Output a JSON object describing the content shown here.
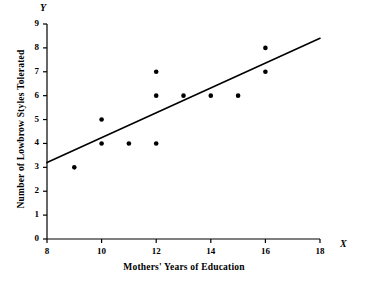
{
  "chart_data": {
    "type": "scatter",
    "title": "",
    "xlabel": "Mothers' Years of Education",
    "ylabel": "Number of Lowbrow Styles Tolerated",
    "x_axis_letter": "X",
    "y_axis_letter": "Y",
    "xlim": [
      8,
      18
    ],
    "ylim": [
      0,
      9
    ],
    "grid": false,
    "legend": "none",
    "x_ticks": [
      8,
      10,
      12,
      14,
      16,
      18
    ],
    "x_tick_labels": [
      "8",
      "10",
      "12",
      "14",
      "16",
      "18"
    ],
    "y_ticks": [
      0,
      1,
      2,
      3,
      4,
      5,
      6,
      7,
      8,
      9
    ],
    "y_tick_labels": [
      "0",
      "1",
      "2",
      "3",
      "4",
      "5",
      "6",
      "7",
      "8",
      "9"
    ],
    "points": [
      {
        "x": 9,
        "y": 3
      },
      {
        "x": 10,
        "y": 5
      },
      {
        "x": 10,
        "y": 4
      },
      {
        "x": 11,
        "y": 4
      },
      {
        "x": 12,
        "y": 7
      },
      {
        "x": 12,
        "y": 6
      },
      {
        "x": 12,
        "y": 4
      },
      {
        "x": 13,
        "y": 6
      },
      {
        "x": 14,
        "y": 6
      },
      {
        "x": 15,
        "y": 6
      },
      {
        "x": 16,
        "y": 8
      },
      {
        "x": 16,
        "y": 7
      }
    ],
    "series": [
      {
        "name": "observations",
        "type": "scatter",
        "marker": "filled-circle",
        "color": "#000000",
        "x": [
          9,
          10,
          10,
          11,
          12,
          12,
          12,
          13,
          14,
          15,
          16,
          16
        ],
        "values": [
          3,
          5,
          4,
          4,
          7,
          6,
          4,
          6,
          6,
          6,
          8,
          7
        ]
      },
      {
        "name": "regression-line",
        "type": "line",
        "color": "#000000",
        "endpoints": [
          {
            "x": 8,
            "y": 3.2
          },
          {
            "x": 18,
            "y": 8.4
          }
        ]
      }
    ],
    "colors": {
      "marker": "#000000",
      "line": "#000000",
      "axis": "#000000",
      "background": "#ffffff"
    }
  }
}
